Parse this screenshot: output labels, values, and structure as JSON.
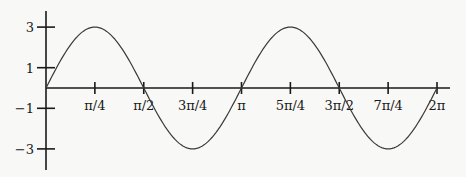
{
  "chart_data": {
    "type": "line",
    "title": "",
    "xlabel": "",
    "ylabel": "",
    "function": "y = 3 sin(2x)",
    "xlim": [
      0,
      6.2832
    ],
    "ylim": [
      -3,
      3
    ],
    "grid": false,
    "legend": null,
    "x_ticks": [
      {
        "value": 0.7854,
        "label": "π/4"
      },
      {
        "value": 1.5708,
        "label": "π/2"
      },
      {
        "value": 2.3562,
        "label": "3π/4"
      },
      {
        "value": 3.1416,
        "label": "π"
      },
      {
        "value": 3.927,
        "label": "5π/4"
      },
      {
        "value": 4.7124,
        "label": "3π/2"
      },
      {
        "value": 5.4978,
        "label": "7π/4"
      },
      {
        "value": 6.2832,
        "label": "2π"
      }
    ],
    "y_ticks": [
      {
        "value": 3,
        "label": "3"
      },
      {
        "value": 1,
        "label": "1"
      },
      {
        "value": -1,
        "label": "−1"
      },
      {
        "value": -3,
        "label": "−3"
      }
    ],
    "series": [
      {
        "name": "3 sin(2x)",
        "x": [
          0,
          0.3927,
          0.7854,
          1.1781,
          1.5708,
          1.9635,
          2.3562,
          2.7489,
          3.1416,
          3.5343,
          3.927,
          4.3197,
          4.7124,
          5.1051,
          5.4978,
          5.8905,
          6.2832
        ],
        "y": [
          0,
          2.12,
          3,
          2.12,
          0,
          -2.12,
          -3,
          -2.12,
          0,
          2.12,
          3,
          2.12,
          0,
          -2.12,
          -3,
          -2.12,
          0
        ]
      }
    ]
  },
  "colors": {
    "axis": "#1a1a1a",
    "curve": "#3a3a3a",
    "background": "#f8f8f6"
  }
}
